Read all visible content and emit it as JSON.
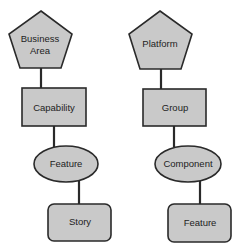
{
  "diagram": {
    "type": "hierarchy",
    "colors": {
      "fill": "#c9c9c9",
      "stroke": "#2a2a2a",
      "text": "#222222",
      "background": "#ffffff"
    },
    "left": {
      "root": {
        "shape": "pentagon",
        "line1": "Business",
        "line2": "Area"
      },
      "level2": {
        "shape": "rectangle",
        "label": "Capability"
      },
      "level3": {
        "shape": "ellipse",
        "label": "Feature"
      },
      "level4": {
        "shape": "rounded-rectangle",
        "label": "Story"
      }
    },
    "right": {
      "root": {
        "shape": "pentagon",
        "label": "Platform"
      },
      "level2": {
        "shape": "rectangle",
        "label": "Group"
      },
      "level3": {
        "shape": "ellipse",
        "label": "Component"
      },
      "level4": {
        "shape": "rounded-rectangle",
        "label": "Feature"
      }
    }
  }
}
